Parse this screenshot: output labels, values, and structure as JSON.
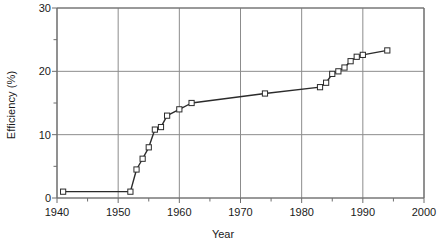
{
  "chart_data": {
    "type": "line",
    "title": "",
    "xlabel": "Year",
    "ylabel": "Efficiency (%)",
    "xlim": [
      1940,
      2000
    ],
    "ylim": [
      0,
      30
    ],
    "xticks": [
      1940,
      1950,
      1960,
      1970,
      1980,
      1990,
      2000
    ],
    "xtick_labels": [
      "1940",
      "1950",
      "1960",
      "1970",
      "1980",
      "1990",
      "2000"
    ],
    "yticks": [
      0,
      10,
      20,
      30
    ],
    "ytick_labels": [
      "0",
      "10",
      "20",
      "30"
    ],
    "x_minor_tick_interval": 5,
    "y_minor_tick_interval": 5,
    "grid": true,
    "grid_axes": "both-major",
    "legend": null,
    "marker": "open-square",
    "line_color": "#2b2b2b",
    "marker_face_color": "#ffffff",
    "marker_edge_color": "#2b2b2b",
    "grid_color": "#8c8c8c",
    "axes_color": "#6e6e6e",
    "series": [
      {
        "name": "Efficiency",
        "x": [
          1941,
          1952,
          1953,
          1954,
          1955,
          1956,
          1957,
          1958,
          1960,
          1962,
          1974,
          1983,
          1984,
          1985,
          1986,
          1987,
          1988,
          1989,
          1990,
          1994
        ],
        "y": [
          1.0,
          1.0,
          4.5,
          6.2,
          8.0,
          10.8,
          11.2,
          13.0,
          14.0,
          15.0,
          16.5,
          17.5,
          18.2,
          19.6,
          20.0,
          20.6,
          21.6,
          22.3,
          22.6,
          23.3
        ]
      }
    ]
  }
}
